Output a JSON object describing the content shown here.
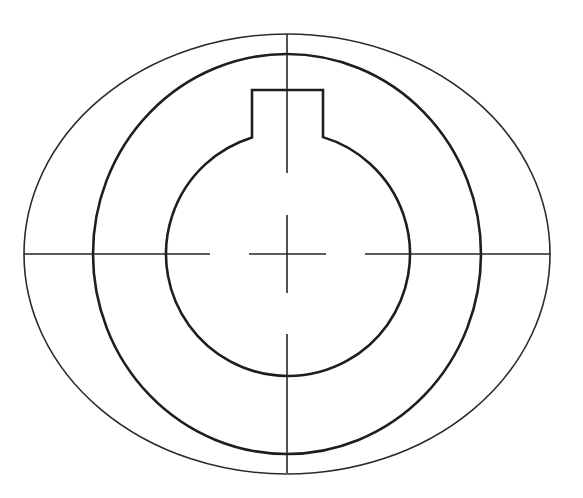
{
  "drawing": {
    "type": "technical-drawing",
    "subject": "keyed-hub-front-view",
    "canvas": {
      "width": 583,
      "height": 498,
      "background": "#ffffff"
    },
    "stroke_color": "#222222",
    "center": {
      "x": 287,
      "y": 254
    },
    "outer_ellipse": {
      "cx": 287,
      "cy": 254,
      "rx": 263,
      "ry": 220,
      "stroke_width": 1.6
    },
    "middle_circle": {
      "cx": 287,
      "cy": 254,
      "rx": 194,
      "ry": 200,
      "stroke_width": 2.6
    },
    "bore": {
      "cx": 288,
      "cy": 254,
      "r": 122,
      "keyway": {
        "left_x": 252,
        "right_x": 323,
        "top_y": 90,
        "join_y": 135
      },
      "stroke_width": 2.6
    },
    "center_lines": {
      "horizontal": [
        {
          "x1": 24,
          "x2": 210
        },
        {
          "x1": 249,
          "x2": 326
        },
        {
          "x1": 365,
          "x2": 550
        }
      ],
      "horizontal_y": 254,
      "vertical": [
        {
          "y1": 34,
          "y2": 173
        },
        {
          "y1": 215,
          "y2": 293
        },
        {
          "y1": 334,
          "y2": 473
        }
      ],
      "vertical_x": 287
    }
  }
}
